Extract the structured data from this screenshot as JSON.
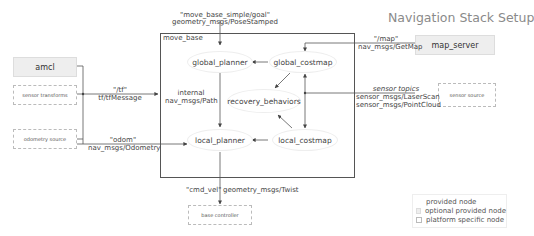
{
  "title": "Navigation Stack Setup",
  "container": {
    "label": "move_base"
  },
  "nodes": {
    "amcl": "amcl",
    "map_server": "map_server",
    "sensor_transforms": "sensor transforms",
    "odometry_source": "odometry source",
    "sensor_source": "sensor source",
    "base_controller": "base controller",
    "global_planner": "global_planner",
    "global_costmap": "global_costmap",
    "recovery_behaviors": "recovery_behaviors",
    "local_planner": "local_planner",
    "local_costmap": "local_costmap"
  },
  "edges": {
    "goal_topic": "\"move_base_simple/goal\"",
    "goal_type": "geometry_msgs/PoseStamped",
    "tf_topic": "\"/tf\"",
    "tf_type": "tf/tfMessage",
    "odom_topic": "\"odom\"",
    "odom_type": "nav_msgs/Odometry",
    "map_topic": "\"/map\"",
    "map_type": "nav_msgs/GetMap",
    "sensor_topic": "sensor topics",
    "sensor_type1": "sensor_msgs/LaserScan",
    "sensor_type2": "sensor_msgs/PointCloud",
    "internal_line1": "internal",
    "internal_line2": "nav_msgs/Path",
    "cmd_vel_topic": "\"cmd_vel\"",
    "cmd_vel_type": "geometry_msgs/Twist"
  },
  "legend": {
    "items": [
      "provided node",
      "optional provided node",
      "platform specific node"
    ]
  }
}
